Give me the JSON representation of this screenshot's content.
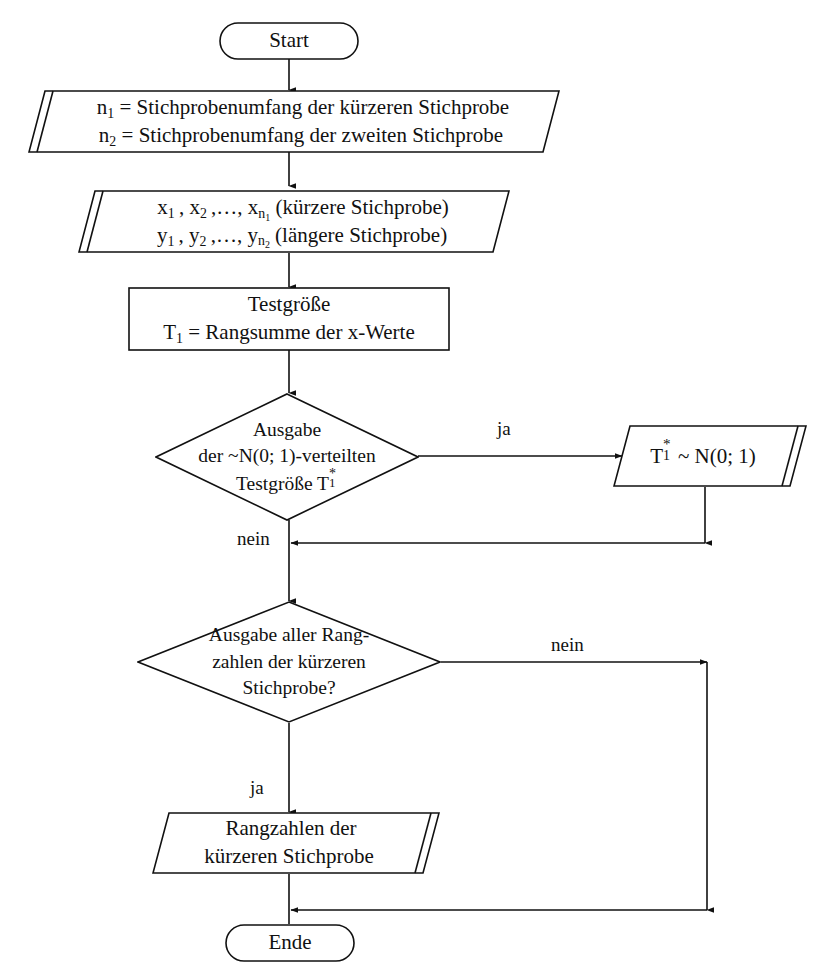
{
  "diagram": {
    "language": "de",
    "line_color": "#111111",
    "background": "#ffffff"
  },
  "nodes": {
    "start": {
      "type": "terminal",
      "label": "Start"
    },
    "input_sizes": {
      "type": "input-parallelogram",
      "line1_prefix": "n",
      "line1_sub": "1",
      "line1_rest": " = Stichprobenumfang der kürzeren Stichprobe",
      "line2_prefix": "n",
      "line2_sub": "2",
      "line2_rest": " = Stichprobenumfang der zweiten Stichprobe",
      "line1_plain": "n1 = Stichprobenumfang der kürzeren Stichprobe",
      "line2_plain": "n2 = Stichprobenumfang der zweiten Stichprobe"
    },
    "input_samples": {
      "type": "input-parallelogram",
      "line1_plain": "x1 , x2 ,…, xn1 (kürzere Stichprobe)",
      "line2_plain": "y1 , y2 ,…, yn2 (längere Stichprobe)",
      "line1_tail": " (kürzere Stichprobe)",
      "line2_tail": " (längere Stichprobe)"
    },
    "process_t1": {
      "type": "process-rectangle",
      "line1": "Testgröße",
      "line2_plain": "T1 = Rangsumme der x-Werte",
      "line2_tail": " = Rangsumme der x-Werte"
    },
    "decision_output_t": {
      "type": "decision-diamond",
      "line1": "Ausgabe",
      "line2": "der ~N(0; 1)-verteilten",
      "line3_plain": "Testgröße T1*",
      "line3_head": "Testgröße T"
    },
    "output_t_star": {
      "type": "output-parallelogram",
      "text_plain": "T1* ~ N(0; 1)",
      "text_tail": " ~ N(0; 1)"
    },
    "decision_output_ranks": {
      "type": "decision-diamond",
      "line1": "Ausgabe aller Rang-",
      "line2": "zahlen der kürzeren",
      "line3": "Stichprobe?"
    },
    "output_ranks": {
      "type": "output-parallelogram",
      "line1": "Rangzahlen der",
      "line2": "kürzeren Stichprobe"
    },
    "end": {
      "type": "terminal",
      "label": "Ende"
    }
  },
  "edge_labels": {
    "decision1_yes": "ja",
    "decision1_no": "nein",
    "decision2_no": "nein",
    "decision2_yes": "ja"
  }
}
